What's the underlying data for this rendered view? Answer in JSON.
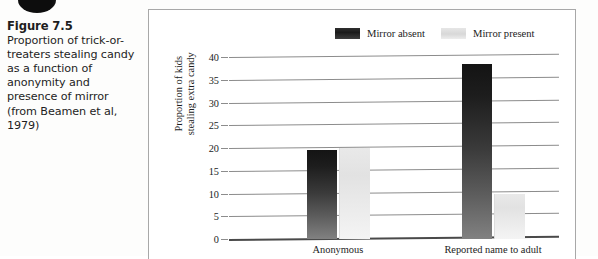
{
  "caption": {
    "title": "Figure 7.5",
    "body": "Proportion of trick-or-treaters stealing candy as a function of anonymity and presence of mirror (from Beamen et al, 1979)"
  },
  "legend": {
    "items": [
      {
        "label": "Mirror absent",
        "swatch": "dark",
        "color": "#1d1d1d"
      },
      {
        "label": "Mirror present",
        "swatch": "light",
        "color": "#e4e4e4"
      }
    ]
  },
  "axes": {
    "y_title_line1": "Proportion of kids",
    "y_title_line2": "stealing extra candy",
    "y_ticks": [
      "40",
      "35",
      "30",
      "25",
      "20",
      "15",
      "10",
      "5",
      "0"
    ]
  },
  "chart_data": {
    "type": "bar",
    "title": "Proportion of trick-or-treaters stealing candy as a function of anonymity and presence of mirror",
    "categories": [
      "Anonymous",
      "Reported name to adult"
    ],
    "series": [
      {
        "name": "Mirror absent",
        "values": [
          19.5,
          38.5
        ],
        "color": "#1d1d1d"
      },
      {
        "name": "Mirror present",
        "values": [
          20,
          10
        ],
        "color": "#e4e4e4"
      }
    ],
    "xlabel": "",
    "ylabel": "Proportion of kids stealing extra candy",
    "ylim": [
      0,
      40
    ],
    "ytick_step": 5,
    "grid": true,
    "legend_position": "top"
  }
}
